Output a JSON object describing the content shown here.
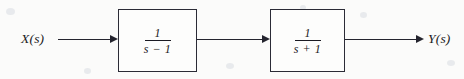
{
  "diagram": {
    "type": "block-diagram",
    "background_color": "#fbfbfa",
    "line_color": "#24242e",
    "text_color": "#1a1a22",
    "input": {
      "label": "X(s)"
    },
    "output": {
      "label": "Y(s)"
    },
    "blocks": [
      {
        "id": "block-1",
        "numerator": "1",
        "denominator": "s − 1",
        "transfer_function": "1/(s − 1)"
      },
      {
        "id": "block-2",
        "numerator": "1",
        "denominator": "s + 1",
        "transfer_function": "1/(s + 1)"
      }
    ],
    "connectors": [
      {
        "id": "wire-in",
        "from": "X(s)",
        "to": "block-1",
        "arrowhead": "filled-triangle-right"
      },
      {
        "id": "wire-mid",
        "from": "block-1",
        "to": "block-2",
        "arrowhead": "filled-triangle-right"
      },
      {
        "id": "wire-out",
        "from": "block-2",
        "to": "Y(s)",
        "arrowhead": "filled-triangle-right"
      }
    ]
  }
}
